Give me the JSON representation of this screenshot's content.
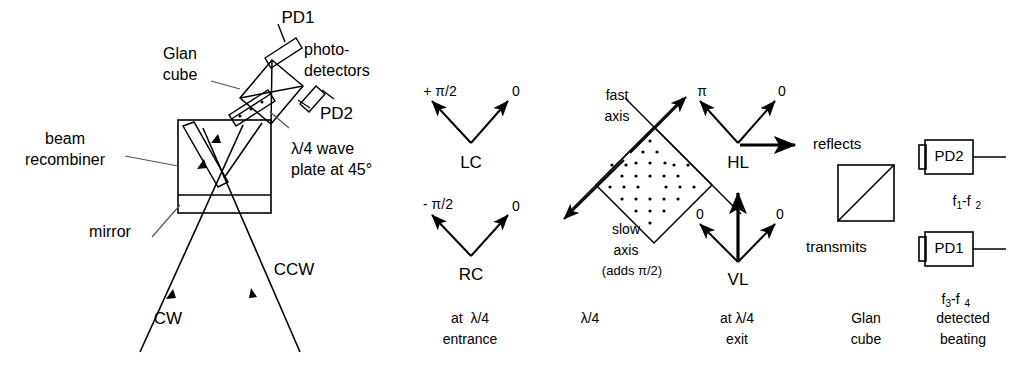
{
  "figure": {
    "kind": "optical-schematic",
    "background": "#ffffff",
    "ink": "#000000"
  },
  "setup": {
    "labels": {
      "pd1": "PD1",
      "photodetectors_line1": "photo-",
      "photodetectors_line2": "detectors",
      "glan_cube_line1": "Glan",
      "glan_cube_line2": "cube",
      "pd2": "PD2",
      "beam_recombiner_line1": "beam",
      "beam_recombiner_line2": "recombiner",
      "waveplate_line1": "λ/4 wave",
      "waveplate_line2": "plate at 45°",
      "mirror": "mirror",
      "cw": "CW",
      "ccw": "CCW"
    }
  },
  "states": {
    "entrance": {
      "caption_line1": "at  λ/4",
      "caption_line2": "entrance",
      "upper": {
        "name": "LC",
        "left_label": "+ π/2",
        "right_label": "0"
      },
      "lower": {
        "name": "RC",
        "left_label": "- π/2",
        "right_label": "0"
      }
    },
    "waveplate": {
      "caption": "λ/4",
      "fast_axis_line1": "fast",
      "fast_axis_line2": "axis",
      "slow_axis_line1": "slow",
      "slow_axis_line2": "axis",
      "slow_axis_line3": "(adds π/2)"
    },
    "exit": {
      "caption_line1": "at λ/4",
      "caption_line2": "exit",
      "upper": {
        "name": "HL",
        "left_label": "π",
        "right_label": "0"
      },
      "lower": {
        "name": "VL",
        "left_label": "0",
        "right_label": "0"
      }
    },
    "glan": {
      "caption_line1": "Glan",
      "caption_line2": "cube",
      "reflects": "reflects",
      "transmits": "transmits"
    },
    "detection": {
      "caption_line1": "detected",
      "caption_line2": "beating",
      "detectors": [
        {
          "name": "PD2",
          "beat_prefix": "f",
          "beat_sub1": "1",
          "beat_mid": "-f",
          "beat_sub2": "2"
        },
        {
          "name": "PD1",
          "beat_prefix": "f",
          "beat_sub1": "3",
          "beat_mid": "-f",
          "beat_sub2": "4"
        }
      ]
    }
  }
}
